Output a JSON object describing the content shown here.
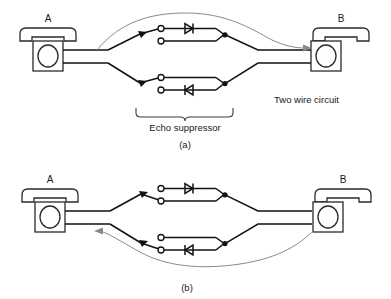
{
  "figure": {
    "title_visible": false,
    "background_color": "#ffffff",
    "ink_color": "#111111",
    "flow_arrow_color": "#8a8a8a"
  },
  "panels": [
    {
      "id": "a",
      "caption": "(a)",
      "left_terminal_label": "A",
      "right_terminal_label": "B",
      "bracket_label": "Echo suppressor",
      "circuit_label": "Two wire circuit",
      "flow_direction": "left-to-right",
      "flow_description": "A to B",
      "upper_branch": {
        "switch_state": "closed-upper",
        "diode_direction": "right",
        "terminals": 2
      },
      "lower_branch": {
        "switch_state": "closed-upper",
        "diode_direction": "left",
        "terminals": 2
      }
    },
    {
      "id": "b",
      "caption": "(b)",
      "left_terminal_label": "A",
      "right_terminal_label": "B",
      "bracket_label": "",
      "circuit_label": "",
      "flow_direction": "right-to-left",
      "flow_description": "B to A",
      "upper_branch": {
        "switch_state": "closed-lower",
        "diode_direction": "right",
        "terminals": 2
      },
      "lower_branch": {
        "switch_state": "closed-lower",
        "diode_direction": "left",
        "terminals": 2
      }
    }
  ],
  "symbols": {
    "telephone": "telephone-icon",
    "diode": "diode-icon",
    "switch": "switch-icon",
    "terminal": "terminal-dot-icon",
    "arrow": "arrow-icon",
    "brace": "curly-brace-icon"
  }
}
